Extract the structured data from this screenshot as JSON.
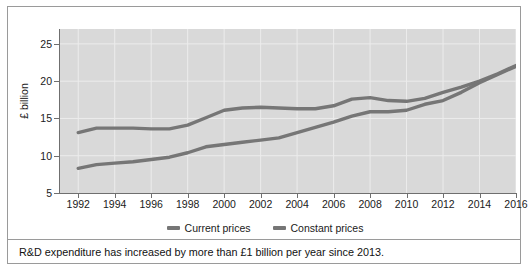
{
  "chart_data": {
    "type": "line",
    "title": "",
    "xlabel": "",
    "ylabel": "£ billion",
    "xlim": [
      1991,
      2016
    ],
    "ylim": [
      5,
      27
    ],
    "grid": true,
    "legend_position": "bottom",
    "x": [
      1992,
      1993,
      1994,
      1995,
      1996,
      1997,
      1998,
      1999,
      2000,
      2001,
      2002,
      2003,
      2004,
      2005,
      2006,
      2007,
      2008,
      2009,
      2010,
      2011,
      2012,
      2013,
      2014,
      2015,
      2016
    ],
    "xtick_labels": [
      "1992",
      "1994",
      "1996",
      "1998",
      "2000",
      "2002",
      "2004",
      "2006",
      "2008",
      "2010",
      "2012",
      "2014",
      "2016"
    ],
    "xticks": [
      1992,
      1994,
      1996,
      1998,
      2000,
      2002,
      2004,
      2006,
      2008,
      2010,
      2012,
      2014,
      2016
    ],
    "ytick_labels": [
      "5",
      "10",
      "15",
      "20",
      "25"
    ],
    "yticks": [
      5,
      10,
      15,
      20,
      25
    ],
    "series": [
      {
        "name": "Current prices",
        "color": "#767676",
        "values": [
          8.3,
          8.8,
          9.0,
          9.2,
          9.5,
          9.8,
          10.4,
          11.2,
          11.5,
          11.8,
          12.1,
          12.4,
          13.1,
          13.8,
          14.5,
          15.3,
          15.9,
          15.9,
          16.1,
          16.9,
          17.4,
          18.5,
          19.8,
          20.9,
          22.0
        ]
      },
      {
        "name": "Constant prices",
        "color": "#767676",
        "values": [
          13.1,
          13.7,
          13.7,
          13.7,
          13.6,
          13.6,
          14.1,
          15.1,
          16.1,
          16.4,
          16.5,
          16.4,
          16.3,
          16.3,
          16.7,
          17.6,
          17.8,
          17.4,
          17.3,
          17.7,
          18.5,
          19.2,
          20.0,
          21.0,
          22.1
        ]
      }
    ]
  },
  "legend": {
    "items": [
      {
        "label": "Current prices",
        "color": "#767676"
      },
      {
        "label": "Constant prices",
        "color": "#767676"
      }
    ]
  },
  "caption": {
    "text": "R&D expenditure has increased by more than £1 billion per year since 2013."
  },
  "axes": {
    "y_title": "£ billion"
  }
}
